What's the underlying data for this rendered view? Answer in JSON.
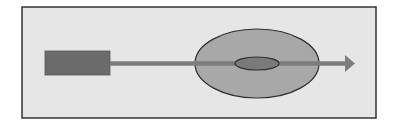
{
  "diagram": {
    "colors": {
      "page_background": "#ffffff",
      "frame_fill": "#e6e6e6",
      "frame_stroke": "#333333",
      "block_fill": "#6b6b6b",
      "block_stroke": "#555555",
      "arrow_color": "#7d7d7d",
      "outer_ellipse_fill": "#a8a8a8",
      "outer_ellipse_stroke": "#2e2e2e",
      "inner_ellipse_fill": "#7a7a7a",
      "inner_ellipse_stroke": "#2e2e2e"
    },
    "frame": {
      "x": 22,
      "y": 7,
      "width": 354,
      "height": 111
    },
    "block": {
      "x": 45,
      "y": 51,
      "width": 65,
      "height": 24
    },
    "arrow": {
      "x1": 110,
      "y1": 63.5,
      "x2": 345,
      "y2": 63.5,
      "thickness": 4.5,
      "head_tip_x": 355,
      "head_half_height": 8.5
    },
    "outer_ellipse": {
      "cx": 257,
      "cy": 63.5,
      "rx": 62,
      "ry": 34.5
    },
    "inner_ellipse": {
      "cx": 257,
      "cy": 63.5,
      "rx": 22,
      "ry": 6.5
    }
  }
}
